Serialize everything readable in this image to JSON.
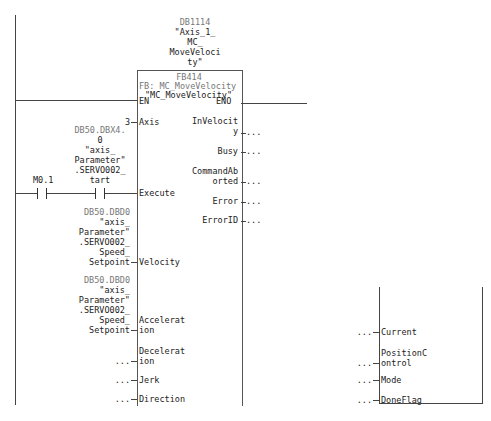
{
  "instance_db": {
    "address": "DB1114",
    "name_lines": [
      "\"Axis_1_",
      "MC_",
      "MoveVeloci",
      "ty\""
    ]
  },
  "block": {
    "number": "FB414",
    "type_label": "FB: MC_MoveVelocity",
    "name": "\"MC_MoveVelocity\"",
    "en": "EN",
    "eno": "ENO",
    "inputs": [
      {
        "name_lines": [
          "Axis"
        ],
        "value": "3"
      },
      {
        "name_lines": [
          "Execute"
        ],
        "value": ""
      },
      {
        "name_lines": [
          "Velocity"
        ],
        "value": ""
      },
      {
        "name_lines": [
          "Accelerat",
          "ion"
        ],
        "value": ""
      },
      {
        "name_lines": [
          "Decelerat",
          "ion"
        ],
        "value": "..."
      },
      {
        "name_lines": [
          "Jerk"
        ],
        "value": "..."
      },
      {
        "name_lines": [
          "Direction"
        ],
        "value": "..."
      }
    ],
    "outputs": [
      {
        "name_lines": [
          "InVelocit",
          "y"
        ],
        "value": "..."
      },
      {
        "name_lines": [
          "Busy"
        ],
        "value": "..."
      },
      {
        "name_lines": [
          "CommandAb",
          "orted"
        ],
        "value": "..."
      },
      {
        "name_lines": [
          "Error"
        ],
        "value": "..."
      },
      {
        "name_lines": [
          "ErrorID"
        ],
        "value": "..."
      }
    ]
  },
  "contacts": [
    {
      "address": "M0.1",
      "symbol_lines": []
    },
    {
      "address": "DB50.DBX4.",
      "symbol_lines": [
        "0",
        "\"axis_",
        "Parameter\"",
        ".SERVO002_",
        "tart"
      ]
    }
  ],
  "velocity_operand": {
    "address": "DB50.DBD0",
    "symbol_lines": [
      "\"axis_",
      "Parameter\"",
      ".SERVO002_",
      "Speed_",
      "Setpoint"
    ]
  },
  "acceleration_operand": {
    "address": "DB50.DBD0",
    "symbol_lines": [
      "\"axis_",
      "Parameter\"",
      ".SERVO002_",
      "Speed_",
      "Setpoint"
    ]
  },
  "second_block_inputs": [
    {
      "name_lines": [
        "Current"
      ],
      "value": "..."
    },
    {
      "name_lines": [
        "PositionC",
        "ontrol"
      ],
      "value": "..."
    },
    {
      "name_lines": [
        "Mode"
      ],
      "value": "..."
    },
    {
      "name_lines": [
        "DoneFlag"
      ],
      "value": "..."
    }
  ]
}
